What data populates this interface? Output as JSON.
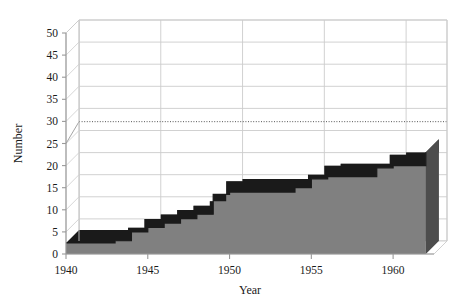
{
  "chart_data": {
    "type": "area",
    "title": "",
    "subtitle": "",
    "xlabel": "Year",
    "ylabel": "Number",
    "xlim": [
      1940,
      1962.5
    ],
    "ylim": [
      0,
      50
    ],
    "ytick_step": 5,
    "xtick_step": 5,
    "grid": true,
    "legend": "none",
    "style_3d": true,
    "fill_color": "#808080",
    "edge_color": "#1a1a1a",
    "side_color": "#4d4d4d",
    "grid_color": "#cccccc",
    "axis_color": "#999999",
    "yticks": [
      0,
      5,
      10,
      15,
      20,
      25,
      30,
      35,
      40,
      45,
      50
    ],
    "ytick_labels": [
      "0",
      "5",
      "10",
      "15",
      "20",
      "25",
      "30",
      "35",
      "40",
      "45",
      "50"
    ],
    "xticks": [
      1940,
      1945,
      1950,
      1955,
      1960
    ],
    "xtick_labels": [
      "1940",
      "1945",
      "1950",
      "1955",
      "1960"
    ],
    "x": [
      1940,
      1941,
      1942,
      1943,
      1944,
      1945,
      1946,
      1947,
      1948,
      1949,
      1950,
      1951,
      1952,
      1953,
      1954,
      1955,
      1956,
      1957,
      1958,
      1959,
      1960,
      1961,
      1962
    ],
    "values": [
      2.5,
      2.5,
      2.5,
      3,
      5,
      6,
      7,
      8,
      9,
      13.5,
      14,
      14,
      14,
      14,
      15,
      17,
      17.5,
      17.5,
      17.5,
      19.5,
      20,
      20,
      23
    ],
    "series": [
      {
        "name": "Number",
        "values": [
          2.5,
          2.5,
          2.5,
          3,
          5,
          6,
          7,
          8,
          9,
          13.5,
          14,
          14,
          14,
          14,
          15,
          17,
          17.5,
          17.5,
          17.5,
          19.5,
          20,
          20,
          23
        ]
      }
    ],
    "annotations": [
      {
        "type": "reference-line",
        "orientation": "horizontal",
        "value": 27,
        "style": "dotted",
        "label": ""
      }
    ]
  }
}
